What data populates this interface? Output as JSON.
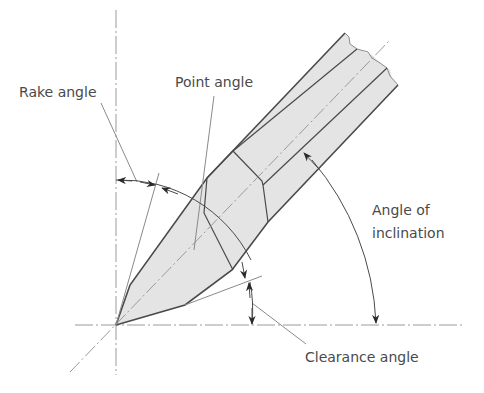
{
  "diagram": {
    "labels": {
      "rake_angle": "Rake angle",
      "point_angle": "Point angle",
      "angle_of_inclination_line1": "Angle of",
      "angle_of_inclination_line2": "inclination",
      "clearance_angle": "Clearance angle"
    },
    "colors": {
      "body_fill": "#e4e4e4",
      "outline": "#4a4a4a",
      "center_line": "#9a9a9a",
      "text": "#4a4a4a"
    }
  }
}
